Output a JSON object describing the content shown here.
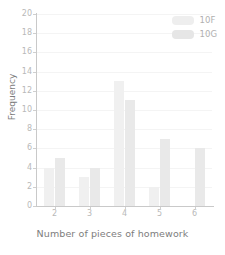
{
  "chart_data": {
    "type": "bar",
    "title": "",
    "xlabel": "Number of pieces of homework",
    "ylabel": "Frequency",
    "categories": [
      "2",
      "3",
      "4",
      "5",
      "6"
    ],
    "series": [
      {
        "name": "10F",
        "values": [
          4,
          3,
          13,
          2,
          0
        ],
        "color": "#f0f0f0"
      },
      {
        "name": "10G",
        "values": [
          5,
          4,
          11,
          7,
          6
        ],
        "color": "#e9e9e9"
      }
    ],
    "ylim": [
      0,
      20
    ],
    "ytick_labels": [
      "0",
      "2",
      "4",
      "6",
      "8",
      "10",
      "12",
      "14",
      "16",
      "18",
      "20"
    ],
    "ytick_values": [
      0,
      2,
      4,
      6,
      8,
      10,
      12,
      14,
      16,
      18,
      20
    ],
    "xtick_labels": [
      "2",
      "3",
      "4",
      "5",
      "6"
    ],
    "grid": true,
    "grid_axis": "y",
    "legend_position": "top-right",
    "background_color": "#ffffff",
    "axis_color": "#c9c9c9",
    "tick_label_color": "#b9b9b9",
    "axis_title_color": "#7d7d7d"
  },
  "legend": {
    "entries": [
      {
        "label": "10F"
      },
      {
        "label": "10G"
      }
    ]
  }
}
